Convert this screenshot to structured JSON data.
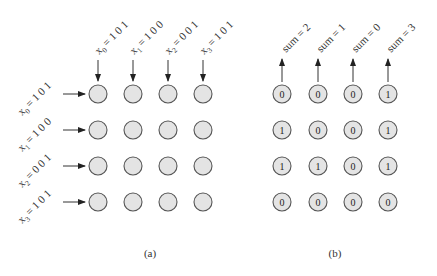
{
  "panel_a": {
    "caption": "(a)",
    "column_inputs": [
      {
        "var": "x",
        "sub": "0",
        "value": "= 1 0 1"
      },
      {
        "var": "x",
        "sub": "1",
        "value": "= 1 0 0"
      },
      {
        "var": "x",
        "sub": "2",
        "value": "= 0 0 1"
      },
      {
        "var": "x",
        "sub": "3",
        "value": "= 1 0 1"
      }
    ],
    "row_inputs": [
      {
        "var": "x",
        "sub": "0",
        "value": "= 1 0 1"
      },
      {
        "var": "x",
        "sub": "1",
        "value": "= 1 0 0"
      },
      {
        "var": "x",
        "sub": "2",
        "value": "= 0 0 1"
      },
      {
        "var": "x",
        "sub": "3",
        "value": "= 1 0 1"
      }
    ],
    "grid_rows": 4,
    "grid_cols": 4
  },
  "panel_b": {
    "caption": "(b)",
    "column_outputs": [
      "sum = 2",
      "sum = 1",
      "sum = 0",
      "sum = 3"
    ],
    "grid": [
      [
        "0",
        "0",
        "0",
        "1"
      ],
      [
        "1",
        "0",
        "0",
        "1"
      ],
      [
        "1",
        "1",
        "0",
        "1"
      ],
      [
        "0",
        "0",
        "0",
        "0"
      ]
    ]
  },
  "colors": {
    "node_fill": "#e4e4e4",
    "node_stroke": "#555555",
    "arrow": "#333333",
    "text": "#333333"
  }
}
